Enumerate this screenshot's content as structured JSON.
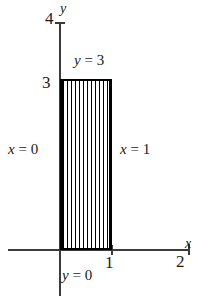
{
  "figure": {
    "type": "math-region-diagram",
    "colors": {
      "axis": "#3b3b3b",
      "region_border": "#000000",
      "hatch": "#000000",
      "background": "#ffffff",
      "text": "#1a1a1a"
    }
  },
  "axes": {
    "x_label": "x",
    "y_label": "y",
    "x_ticks": [
      "1",
      "2"
    ],
    "y_ticks": [
      "3",
      "4"
    ]
  },
  "labels": {
    "y_axis_name": "y",
    "x_axis_name": "x",
    "y_tick_4": "4",
    "y_tick_3": "3",
    "x_tick_1": "1",
    "x_tick_2": "2",
    "boundary_top": "y = 3",
    "boundary_left": "x = 0",
    "boundary_right": "x = 1",
    "boundary_bottom": "y = 0"
  },
  "chart_data": {
    "type": "area",
    "title": "",
    "xlabel": "x",
    "ylabel": "y",
    "xlim": [
      0,
      2
    ],
    "ylim": [
      0,
      4
    ],
    "xticks": [
      1,
      2
    ],
    "yticks": [
      3,
      4
    ],
    "grid": false,
    "legend": null,
    "region": {
      "name": "hatched rectangle",
      "x_min": 0,
      "x_max": 1,
      "y_min": 0,
      "y_max": 3,
      "fill": "vertical-hatch",
      "hatch_line_count": 13
    },
    "annotations": [
      {
        "text": "y = 3",
        "boundary": "top",
        "at": [
          0.5,
          3.0
        ]
      },
      {
        "text": "x = 0",
        "boundary": "left",
        "at": [
          0.0,
          1.5
        ]
      },
      {
        "text": "x = 1",
        "boundary": "right",
        "at": [
          1.0,
          1.5
        ]
      },
      {
        "text": "y = 0",
        "boundary": "bottom",
        "at": [
          0.5,
          0.0
        ]
      }
    ]
  }
}
